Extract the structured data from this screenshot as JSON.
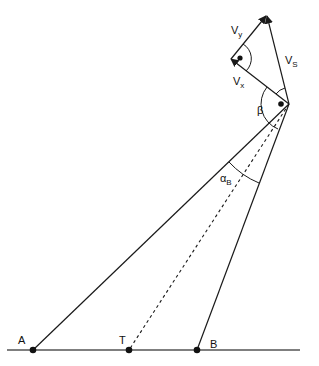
{
  "diagram": {
    "type": "vector-geometry",
    "background": "#ffffff",
    "stroke_color": "#1a1a1a",
    "points": {
      "A": {
        "label": "A",
        "x": 33,
        "y": 350
      },
      "T": {
        "label": "T",
        "x": 129,
        "y": 350
      },
      "B": {
        "label": "B",
        "x": 197,
        "y": 350
      },
      "S": {
        "label": "",
        "x": 289,
        "y": 104
      }
    },
    "vectors": {
      "vx": {
        "label": "V",
        "sub": "x"
      },
      "vy": {
        "label": "V",
        "sub": "y"
      },
      "vs": {
        "label": "V",
        "sub": "S"
      }
    },
    "angles": {
      "beta": {
        "label": "β"
      },
      "alpha_b": {
        "label": "α",
        "sub": "B"
      }
    }
  }
}
